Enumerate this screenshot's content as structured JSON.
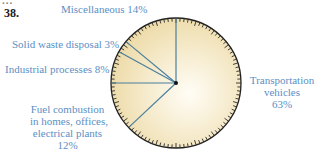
{
  "question_number": "38.",
  "cutoff_text": "...",
  "labels": {
    "misc": "Miscellaneous 14%",
    "solid": "Solid waste disposal 3%",
    "industrial": "Industrial processes 8%",
    "fuel_lines": [
      "Fuel combustion",
      "in homes, offices,",
      "electrical plants",
      "12%"
    ],
    "trans_lines": [
      "Transportation",
      "vehicles",
      "63%"
    ]
  },
  "colors": {
    "fill_center": "#fffdf6",
    "fill_edge": "#ecd9a4",
    "divider": "#4a7f9e",
    "outline": "#222222",
    "label": "#5b8fc4"
  },
  "chart_data": {
    "type": "pie",
    "title": "",
    "start_angle_deg": 0,
    "direction": "clockwise",
    "categories": [
      "Transportation vehicles",
      "Fuel combustion in homes, offices, electrical plants",
      "Industrial processes",
      "Solid waste disposal",
      "Miscellaneous"
    ],
    "values": [
      63,
      12,
      8,
      3,
      14
    ],
    "unit": "%",
    "legend": "none (direct labels)",
    "style": "clock-face with tick marks around rim"
  }
}
